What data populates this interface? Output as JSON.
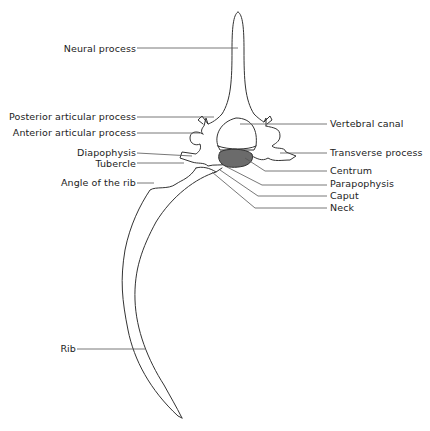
{
  "diagram": {
    "colors": {
      "line": "#333333",
      "leader": "#555555",
      "centrum_fill": "#6b6b6b",
      "text": "#222222",
      "background": "#ffffff"
    },
    "labels_left": [
      {
        "id": "neural-process",
        "text": "Neural process"
      },
      {
        "id": "posterior-articular-process",
        "text": "Posterior articular process"
      },
      {
        "id": "anterior-articular-process",
        "text": "Anterior articular process"
      },
      {
        "id": "diapophysis",
        "text": "Diapophysis"
      },
      {
        "id": "tubercle",
        "text": "Tubercle"
      },
      {
        "id": "angle-of-the-rib",
        "text": "Angle of the rib"
      },
      {
        "id": "rib",
        "text": "Rib"
      }
    ],
    "labels_right": [
      {
        "id": "vertebral-canal",
        "text": "Vertebral canal"
      },
      {
        "id": "transverse-process",
        "text": "Transverse process"
      },
      {
        "id": "centrum",
        "text": "Centrum"
      },
      {
        "id": "parapophysis",
        "text": "Parapophysis"
      },
      {
        "id": "caput",
        "text": "Caput"
      },
      {
        "id": "neck",
        "text": "Neck"
      }
    ]
  }
}
